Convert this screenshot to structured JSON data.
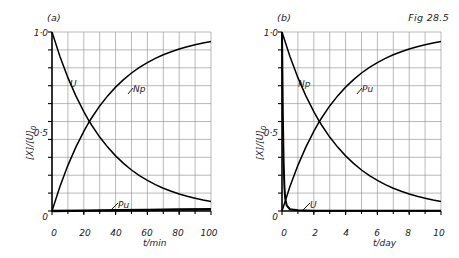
{
  "figure": {
    "caption": "Fig 28.5",
    "panels": [
      {
        "tag": "(a)",
        "ylabel_main": "[X]/[U]",
        "ylabel_sub": "0",
        "xlabel": "t/min",
        "yticks": [
          "1·0",
          "0·5",
          "0"
        ],
        "ytick_values": [
          1.0,
          0.5,
          0
        ],
        "xticks": [
          "0",
          "20",
          "40",
          "60",
          "80",
          "100"
        ],
        "xtick_values": [
          0,
          20,
          40,
          60,
          80,
          100
        ],
        "curve_labels": [
          {
            "name": "U",
            "text": "U"
          },
          {
            "name": "Np",
            "text": "Np"
          },
          {
            "name": "Pu",
            "text": "Pu"
          }
        ]
      },
      {
        "tag": "(b)",
        "ylabel_main": "[X]/[U]",
        "ylabel_sub": "0",
        "xlabel": "t/day",
        "yticks": [
          "1·0",
          "0·5",
          "0"
        ],
        "ytick_values": [
          1.0,
          0.5,
          0
        ],
        "xticks": [
          "0",
          "2",
          "4",
          "6",
          "8",
          "10"
        ],
        "xtick_values": [
          0,
          2,
          4,
          6,
          8,
          10
        ],
        "curve_labels": [
          {
            "name": "Np",
            "text": "Np"
          },
          {
            "name": "Pu",
            "text": "Pu"
          },
          {
            "name": "U",
            "text": "U"
          }
        ]
      }
    ]
  },
  "chart_data": [
    {
      "type": "line",
      "title": "(a)",
      "xlabel": "t/min",
      "ylabel": "[X]/[U]0",
      "xlim": [
        0,
        100
      ],
      "ylim": [
        0,
        1.0
      ],
      "grid": true,
      "xticks": [
        0,
        20,
        40,
        60,
        80,
        100
      ],
      "yticks": [
        0,
        0.5,
        1.0
      ],
      "grid_columns": 10,
      "grid_rows": 10,
      "legend": "inline-labels",
      "half_life_min": 23.5,
      "series": [
        {
          "name": "U",
          "label": "U",
          "kind": "decay",
          "x": [
            0,
            5,
            10,
            15,
            20,
            23.5,
            25,
            30,
            35,
            40,
            45,
            50,
            55,
            60,
            65,
            70,
            75,
            80,
            85,
            90,
            95,
            100
          ],
          "values": [
            1.0,
            0.863,
            0.745,
            0.643,
            0.555,
            0.5,
            0.479,
            0.413,
            0.357,
            0.308,
            0.266,
            0.229,
            0.198,
            0.171,
            0.147,
            0.127,
            0.11,
            0.095,
            0.082,
            0.071,
            0.061,
            0.053
          ]
        },
        {
          "name": "Np",
          "label": "Np",
          "kind": "growth",
          "x": [
            0,
            5,
            10,
            15,
            20,
            23.5,
            25,
            30,
            35,
            40,
            45,
            50,
            55,
            60,
            65,
            70,
            75,
            80,
            85,
            90,
            95,
            100
          ],
          "values": [
            0.0,
            0.137,
            0.255,
            0.357,
            0.445,
            0.5,
            0.521,
            0.587,
            0.643,
            0.692,
            0.734,
            0.771,
            0.802,
            0.829,
            0.853,
            0.873,
            0.89,
            0.905,
            0.918,
            0.929,
            0.939,
            0.947
          ]
        },
        {
          "name": "Pu",
          "label": "Pu",
          "kind": "flat",
          "x": [
            0,
            20,
            40,
            60,
            80,
            100
          ],
          "values": [
            0.0,
            0.002,
            0.004,
            0.006,
            0.008,
            0.01
          ]
        }
      ]
    },
    {
      "type": "line",
      "title": "(b)",
      "xlabel": "t/day",
      "ylabel": "[X]/[U]0",
      "xlim": [
        0,
        10
      ],
      "ylim": [
        0,
        1.0
      ],
      "grid": true,
      "xticks": [
        0,
        2,
        4,
        6,
        8,
        10
      ],
      "yticks": [
        0,
        0.5,
        1.0
      ],
      "grid_columns": 10,
      "grid_rows": 10,
      "legend": "inline-labels",
      "half_life_day": 2.35,
      "series": [
        {
          "name": "Np",
          "label": "Np",
          "kind": "decay",
          "x": [
            0,
            0.5,
            1,
            1.5,
            2,
            2.35,
            2.5,
            3,
            3.5,
            4,
            4.5,
            5,
            5.5,
            6,
            6.5,
            7,
            7.5,
            8,
            8.5,
            9,
            9.5,
            10
          ],
          "values": [
            1.0,
            0.863,
            0.745,
            0.643,
            0.555,
            0.5,
            0.479,
            0.413,
            0.357,
            0.308,
            0.266,
            0.229,
            0.198,
            0.171,
            0.147,
            0.127,
            0.11,
            0.095,
            0.082,
            0.071,
            0.061,
            0.053
          ]
        },
        {
          "name": "Pu",
          "label": "Pu",
          "kind": "growth",
          "x": [
            0,
            0.5,
            1,
            1.5,
            2,
            2.35,
            2.5,
            3,
            3.5,
            4,
            4.5,
            5,
            5.5,
            6,
            6.5,
            7,
            7.5,
            8,
            8.5,
            9,
            9.5,
            10
          ],
          "values": [
            0.0,
            0.137,
            0.255,
            0.357,
            0.445,
            0.5,
            0.521,
            0.587,
            0.643,
            0.692,
            0.734,
            0.771,
            0.802,
            0.829,
            0.853,
            0.873,
            0.89,
            0.905,
            0.918,
            0.929,
            0.939,
            0.947
          ]
        },
        {
          "name": "U",
          "label": "U",
          "kind": "spike-decay",
          "x": [
            0,
            0.05,
            0.1,
            0.15,
            0.2,
            0.3,
            0.5,
            1,
            2,
            4,
            6,
            8,
            10
          ],
          "values": [
            1.0,
            0.55,
            0.28,
            0.14,
            0.07,
            0.03,
            0.01,
            0.004,
            0.002,
            0.002,
            0.002,
            0.002,
            0.002
          ]
        }
      ]
    }
  ]
}
